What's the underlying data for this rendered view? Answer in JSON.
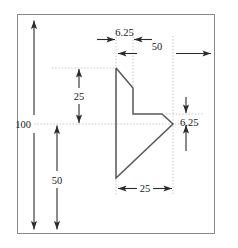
{
  "drawing": {
    "type": "engineering-dimension-drawing",
    "border_color": "#8a8a8a",
    "profile_color": "#555555",
    "dimension_color": "#2b2b2b",
    "extension_color": "#b9b9b9",
    "dimensions": [
      {
        "id": "top-6-25",
        "label": "6.25",
        "orientation": "horizontal",
        "arrows": "inward"
      },
      {
        "id": "top-50",
        "label": "50",
        "orientation": "horizontal",
        "arrows": "outward"
      },
      {
        "id": "left-100",
        "label": "100",
        "orientation": "vertical",
        "arrows": "outward"
      },
      {
        "id": "mid-25",
        "label": "25",
        "orientation": "vertical",
        "arrows": "outward"
      },
      {
        "id": "left-50",
        "label": "50",
        "orientation": "vertical",
        "arrows": "outward"
      },
      {
        "id": "right-6-25",
        "label": "6.25",
        "orientation": "vertical",
        "arrows": "inward"
      },
      {
        "id": "bottom-25",
        "label": "25",
        "orientation": "horizontal",
        "arrows": "outward"
      }
    ],
    "profile_vertices": "116,68 133,88 133,114 162,114 173,124 116,178 116,68"
  }
}
